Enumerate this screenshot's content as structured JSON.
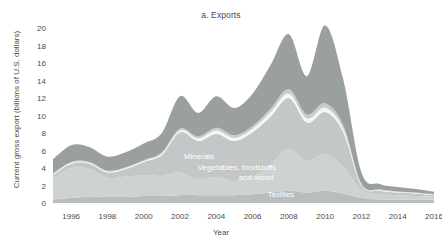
{
  "figure": {
    "top_caption": "",
    "title": "a. Exports",
    "xlabel": "Year",
    "ylabel": "Current gross export (billions of U.S. dollars)"
  },
  "chart_data": {
    "type": "area",
    "title": "a. Exports",
    "xlabel": "Year",
    "ylabel": "Current gross export (billions of U.S. dollars)",
    "stacked": true,
    "grid": false,
    "legend": "inline-labels",
    "xlim": [
      1995,
      2016
    ],
    "ylim": [
      0,
      20
    ],
    "yticks": [
      0,
      2,
      4,
      6,
      8,
      10,
      12,
      14,
      16,
      18,
      20
    ],
    "xticks": [
      1996,
      1998,
      2000,
      2002,
      2004,
      2006,
      2008,
      2010,
      2012,
      2014,
      2016
    ],
    "x": [
      1995,
      1996,
      1997,
      1998,
      1999,
      2000,
      2001,
      2002,
      2003,
      2004,
      2005,
      2006,
      2007,
      2008,
      2009,
      2010,
      2011,
      2012,
      2013,
      2014,
      2015,
      2016
    ],
    "series": [
      {
        "name": "Textiles",
        "color": "#b9bdbd",
        "values": [
          0.4,
          0.6,
          0.7,
          0.7,
          0.7,
          0.8,
          0.8,
          0.9,
          0.9,
          0.9,
          0.9,
          1.0,
          1.2,
          1.4,
          1.2,
          1.4,
          1.1,
          0.6,
          0.4,
          0.4,
          0.4,
          0.4
        ]
      },
      {
        "name": "Vegetables, foodstuffs and wood",
        "color": "#cfd2d2",
        "values": [
          2.4,
          3.4,
          3.2,
          2.2,
          2.3,
          2.4,
          2.3,
          2.6,
          1.8,
          2.1,
          1.6,
          2.0,
          3.2,
          4.8,
          3.6,
          4.2,
          3.0,
          0.9,
          0.6,
          0.5,
          0.4,
          0.3
        ]
      },
      {
        "name": "Minerals",
        "color": "#c4c7c7",
        "values": [
          0.4,
          0.5,
          0.6,
          0.6,
          0.9,
          1.5,
          2.4,
          4.6,
          4.4,
          4.9,
          4.6,
          5.1,
          5.5,
          5.8,
          4.4,
          4.8,
          4.0,
          0.5,
          0.4,
          0.3,
          0.3,
          0.2
        ]
      },
      {
        "name": "Separator",
        "color": "#f4f5f5",
        "values": [
          0.1,
          0.1,
          0.1,
          0.1,
          0.1,
          0.1,
          0.15,
          0.2,
          0.3,
          0.4,
          0.35,
          0.4,
          0.5,
          0.5,
          0.45,
          0.5,
          0.4,
          0.1,
          0.08,
          0.06,
          0.05,
          0.05
        ]
      },
      {
        "name": "Other",
        "color": "#c9cccc",
        "values": [
          0.1,
          0.1,
          0.1,
          0.1,
          0.1,
          0.1,
          0.15,
          0.2,
          0.2,
          0.3,
          0.3,
          0.3,
          0.4,
          0.5,
          0.45,
          0.5,
          0.4,
          0.1,
          0.08,
          0.06,
          0.05,
          0.05
        ]
      },
      {
        "name": "Machinery and other",
        "color": "#9aa0a0",
        "values": [
          1.6,
          1.9,
          1.7,
          1.6,
          1.7,
          1.9,
          2.2,
          3.7,
          2.7,
          3.6,
          3.1,
          3.7,
          5.0,
          6.3,
          4.4,
          8.9,
          5.2,
          1.3,
          0.6,
          0.5,
          0.4,
          0.3
        ]
      }
    ],
    "inline_labels": [
      {
        "text": "Minerals",
        "x": 199,
        "y": 159
      },
      {
        "text": "Vegetables, foodstuffs",
        "x": 237,
        "y": 170
      },
      {
        "text": "and wood",
        "x": 256,
        "y": 180
      },
      {
        "text": "Textiles",
        "x": 281,
        "y": 197
      }
    ]
  }
}
